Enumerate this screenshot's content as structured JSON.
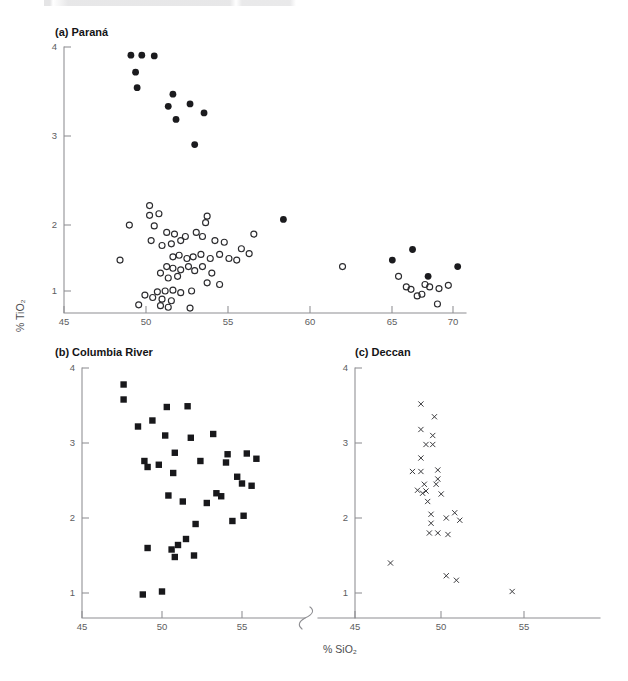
{
  "figure": {
    "axis_title_x": "% SiO₂",
    "axis_title_y": "% TiO₂",
    "header_fragment": ""
  },
  "panels": {
    "a": {
      "title": "(a) Paraná",
      "xticks": [
        "45",
        "50",
        "55",
        "60",
        "65",
        "70"
      ],
      "yticks": [
        "1",
        "2",
        "3",
        "4"
      ]
    },
    "b": {
      "title": "(b) Columbia River",
      "xticks": [
        "45",
        "50",
        "55"
      ],
      "yticks": [
        "1",
        "2",
        "3",
        "4"
      ]
    },
    "c": {
      "title": "(c) Deccan",
      "xticks": [
        "45",
        "50",
        "55"
      ],
      "yticks": [
        "1",
        "2",
        "3",
        "4"
      ]
    }
  },
  "chart_data": [
    {
      "type": "scatter",
      "title": "(a) Paraná",
      "xlabel": "% SiO₂",
      "ylabel": "% TiO₂",
      "xlim": [
        45,
        71.5
      ],
      "ylim": [
        0.72,
        4.05
      ],
      "xticks": [
        45,
        50,
        55,
        60,
        65,
        70
      ],
      "yticks": [
        1,
        2,
        3,
        4
      ],
      "grid": false,
      "legend": "none",
      "series": [
        {
          "name": "Paraná high-Ti / silicic (filled circles)",
          "marker": "filled-circle",
          "points": [
            [
              49.3,
              3.9
            ],
            [
              50.0,
              3.9
            ],
            [
              50.8,
              3.89
            ],
            [
              49.6,
              3.69
            ],
            [
              49.7,
              3.5
            ],
            [
              52.0,
              3.42
            ],
            [
              51.7,
              3.27
            ],
            [
              53.1,
              3.3
            ],
            [
              52.2,
              3.11
            ],
            [
              54.0,
              3.19
            ],
            [
              53.4,
              2.8
            ],
            [
              59.1,
              1.88
            ],
            [
              66.1,
              1.38
            ],
            [
              67.4,
              1.51
            ],
            [
              68.4,
              1.18
            ],
            [
              70.3,
              1.3
            ]
          ]
        },
        {
          "name": "Paraná low-Ti basalts (open circles)",
          "marker": "open-circle",
          "points": [
            [
              50.5,
              2.05
            ],
            [
              50.5,
              1.93
            ],
            [
              51.1,
              1.95
            ],
            [
              49.2,
              1.81
            ],
            [
              50.8,
              1.8
            ],
            [
              51.6,
              1.72
            ],
            [
              52.1,
              1.7
            ],
            [
              52.8,
              1.67
            ],
            [
              53.5,
              1.72
            ],
            [
              54.2,
              1.92
            ],
            [
              54.1,
              1.84
            ],
            [
              53.9,
              1.67
            ],
            [
              52.5,
              1.62
            ],
            [
              51.9,
              1.58
            ],
            [
              51.3,
              1.56
            ],
            [
              50.6,
              1.62
            ],
            [
              54.7,
              1.62
            ],
            [
              55.3,
              1.6
            ],
            [
              57.2,
              1.7
            ],
            [
              56.4,
              1.52
            ],
            [
              56.9,
              1.46
            ],
            [
              48.6,
              1.38
            ],
            [
              52.0,
              1.42
            ],
            [
              52.4,
              1.44
            ],
            [
              52.9,
              1.4
            ],
            [
              53.3,
              1.42
            ],
            [
              53.8,
              1.45
            ],
            [
              54.4,
              1.4
            ],
            [
              55.0,
              1.45
            ],
            [
              55.6,
              1.4
            ],
            [
              56.1,
              1.38
            ],
            [
              51.6,
              1.3
            ],
            [
              52.0,
              1.28
            ],
            [
              52.5,
              1.26
            ],
            [
              53.0,
              1.3
            ],
            [
              53.4,
              1.25
            ],
            [
              53.9,
              1.3
            ],
            [
              54.5,
              1.22
            ],
            [
              51.2,
              1.22
            ],
            [
              51.7,
              1.16
            ],
            [
              52.3,
              1.18
            ],
            [
              54.2,
              1.1
            ],
            [
              55.0,
              1.08
            ],
            [
              51.0,
              0.99
            ],
            [
              51.5,
              1.0
            ],
            [
              52.0,
              1.01
            ],
            [
              52.5,
              0.98
            ],
            [
              53.2,
              1.0
            ],
            [
              50.2,
              0.95
            ],
            [
              50.7,
              0.92
            ],
            [
              51.3,
              0.9
            ],
            [
              51.9,
              0.88
            ],
            [
              49.8,
              0.83
            ],
            [
              51.2,
              0.82
            ],
            [
              51.7,
              0.8
            ],
            [
              53.1,
              0.79
            ],
            [
              62.9,
              1.3
            ],
            [
              66.5,
              1.18
            ],
            [
              67.0,
              1.05
            ],
            [
              67.3,
              1.02
            ],
            [
              67.7,
              0.94
            ],
            [
              68.0,
              0.96
            ],
            [
              68.2,
              1.08
            ],
            [
              68.5,
              1.05
            ],
            [
              69.0,
              0.84
            ],
            [
              69.1,
              1.03
            ],
            [
              69.7,
              1.07
            ]
          ]
        }
      ]
    },
    {
      "type": "scatter",
      "title": "(b) Columbia River",
      "xlabel": "% SiO₂",
      "ylabel": "% TiO₂",
      "xlim": [
        45,
        58.5
      ],
      "ylim": [
        0.72,
        4.05
      ],
      "xticks": [
        45,
        50,
        55
      ],
      "yticks": [
        1,
        2,
        3,
        4
      ],
      "grid": false,
      "legend": "none",
      "series": [
        {
          "name": "Columbia River basalts",
          "marker": "filled-square",
          "points": [
            [
              47.6,
              3.78
            ],
            [
              47.6,
              3.58
            ],
            [
              50.3,
              3.48
            ],
            [
              51.6,
              3.49
            ],
            [
              48.5,
              3.22
            ],
            [
              49.4,
              3.3
            ],
            [
              50.2,
              3.1
            ],
            [
              51.8,
              3.07
            ],
            [
              53.2,
              3.12
            ],
            [
              50.8,
              2.87
            ],
            [
              48.9,
              2.76
            ],
            [
              52.4,
              2.76
            ],
            [
              54.1,
              2.85
            ],
            [
              55.3,
              2.86
            ],
            [
              55.9,
              2.79
            ],
            [
              49.1,
              2.68
            ],
            [
              49.8,
              2.71
            ],
            [
              50.7,
              2.6
            ],
            [
              54.0,
              2.74
            ],
            [
              55.0,
              2.46
            ],
            [
              54.7,
              2.55
            ],
            [
              55.6,
              2.43
            ],
            [
              53.4,
              2.33
            ],
            [
              52.8,
              2.2
            ],
            [
              51.3,
              2.22
            ],
            [
              50.4,
              2.3
            ],
            [
              53.7,
              2.29
            ],
            [
              55.1,
              2.03
            ],
            [
              54.4,
              1.96
            ],
            [
              52.1,
              1.92
            ],
            [
              51.5,
              1.72
            ],
            [
              51.0,
              1.64
            ],
            [
              50.6,
              1.58
            ],
            [
              50.8,
              1.48
            ],
            [
              49.1,
              1.6
            ],
            [
              52.0,
              1.5
            ],
            [
              48.8,
              0.98
            ],
            [
              50.0,
              1.02
            ]
          ]
        }
      ]
    },
    {
      "type": "scatter",
      "title": "(c) Deccan",
      "xlabel": "% SiO₂",
      "ylabel": "% TiO₂",
      "xlim": [
        45,
        57
      ],
      "ylim": [
        0.72,
        4.05
      ],
      "xticks": [
        45,
        50,
        55
      ],
      "yticks": [
        1,
        2,
        3,
        4
      ],
      "grid": false,
      "legend": "none",
      "series": [
        {
          "name": "Deccan basalts",
          "marker": "cross",
          "points": [
            [
              48.9,
              3.52
            ],
            [
              49.7,
              3.35
            ],
            [
              48.9,
              3.18
            ],
            [
              49.6,
              3.1
            ],
            [
              49.2,
              2.98
            ],
            [
              49.6,
              2.98
            ],
            [
              48.9,
              2.8
            ],
            [
              48.4,
              2.62
            ],
            [
              48.9,
              2.62
            ],
            [
              49.9,
              2.64
            ],
            [
              49.9,
              2.52
            ],
            [
              49.1,
              2.45
            ],
            [
              49.8,
              2.45
            ],
            [
              48.7,
              2.37
            ],
            [
              49.2,
              2.36
            ],
            [
              49.0,
              2.33
            ],
            [
              50.1,
              2.32
            ],
            [
              49.3,
              2.22
            ],
            [
              49.5,
              2.05
            ],
            [
              50.9,
              2.07
            ],
            [
              50.4,
              2.0
            ],
            [
              51.2,
              1.97
            ],
            [
              49.5,
              1.93
            ],
            [
              49.4,
              1.8
            ],
            [
              49.9,
              1.8
            ],
            [
              50.5,
              1.78
            ],
            [
              47.1,
              1.4
            ],
            [
              50.4,
              1.23
            ],
            [
              51.0,
              1.17
            ],
            [
              54.3,
              1.02
            ]
          ]
        }
      ]
    }
  ]
}
